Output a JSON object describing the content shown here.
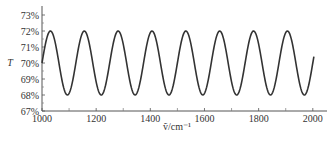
{
  "chart_data": {
    "type": "line",
    "title": "",
    "xlabel": "ṽ/cm⁻¹",
    "ylabel": "T",
    "xlim": [
      1000,
      2050
    ],
    "ylim": [
      67,
      73.5
    ],
    "x_ticks": [
      1000,
      1200,
      1400,
      1600,
      1800,
      2000
    ],
    "x_minor_ticks": [
      1100,
      1300,
      1500,
      1700,
      1900
    ],
    "y_ticks": [
      67,
      68,
      69,
      70,
      71,
      72,
      73
    ],
    "y_tick_labels": [
      "67%",
      "68%",
      "69%",
      "70%",
      "71%",
      "72%",
      "73%"
    ],
    "grid": false,
    "legend": null,
    "series": [
      {
        "name": "T",
        "description": "sinusoidal transmittance oscillation, T = 70 + 2·sin(2π(ṽ−1000)/125) %",
        "x": [
          1000,
          1031,
          1062,
          1094,
          1125,
          1156,
          1187,
          1219,
          1250,
          1281,
          1312,
          1344,
          1375,
          1406,
          1437,
          1469,
          1500,
          1531,
          1562,
          1594,
          1625,
          1656,
          1687,
          1719,
          1750,
          1781,
          1812,
          1844,
          1875,
          1906,
          1937,
          1969,
          2000
        ],
        "y": [
          70,
          72,
          70,
          68,
          70,
          72,
          70,
          68,
          70,
          72,
          70,
          68,
          70,
          72,
          70,
          68,
          70,
          72,
          70,
          68,
          70,
          72,
          70,
          68,
          70,
          72,
          70,
          68,
          70,
          72,
          70,
          68,
          69.6
        ],
        "mean": 70,
        "amplitude": 2,
        "period": 125,
        "x_start": 1000,
        "x_end": 2005,
        "color": "#333333"
      }
    ]
  }
}
